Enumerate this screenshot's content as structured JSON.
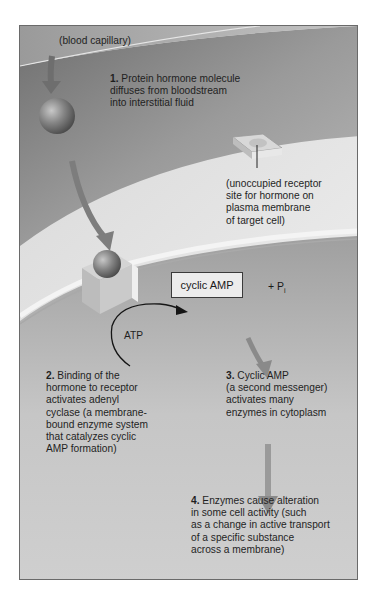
{
  "figure": {
    "labels": {
      "blood_capillary": "(blood capillary)",
      "receptor_site": "(unoccupied receptor\nsite for hormone on\nplasma membrane\nof target cell)",
      "atp": "ATP",
      "camp": "cyclic AMP",
      "pi_prefix": "+ P",
      "pi_sub": "i"
    },
    "steps": [
      {
        "num": "1.",
        "text": " Protein hormone molecule\ndiffuses from bloodstream\ninto interstitial fluid"
      },
      {
        "num": "2.",
        "text": " Binding of the\nhormone to receptor\nactivates adenyl\ncyclase (a membrane-\nbound enzyme system\nthat catalyzes cyclic\nAMP formation)"
      },
      {
        "num": "3.",
        "text": " Cyclic AMP\n(a second messenger)\nactivates many\nenzymes in cytoplasm"
      },
      {
        "num": "4.",
        "text": " Enzymes cause alteration\nin some cell activity (such\nas a change in active transport\nof a specific substance\nacross a membrane)"
      }
    ],
    "colors": {
      "capillary": "#a8a8a8",
      "interstitial": "#8c8c8c",
      "membrane_top": "#e2e2e2",
      "cytoplasm_dark": "#6e6e6e",
      "cytoplasm_light": "#d0d0d0",
      "arrow": "#7a7a7a",
      "hormone": "#8a8a8a"
    }
  }
}
